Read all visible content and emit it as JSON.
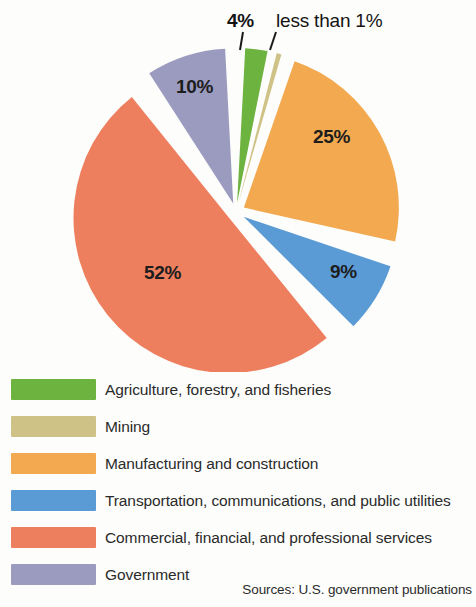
{
  "chart_data": {
    "type": "pie",
    "title": "",
    "subtitle": "",
    "xlabel": "",
    "ylabel": "",
    "grid": false,
    "legend_position": "bottom-left",
    "total": 100,
    "start_angle_deg": 0,
    "direction": "clockwise",
    "exploded": true,
    "categories": [
      "Agriculture, forestry, and fisheries",
      "Mining",
      "Manufacturing and construction",
      "Transportation, communications, and public utilities",
      "Commercial, financial, and professional services",
      "Government"
    ],
    "values": [
      4,
      0.5,
      25,
      9,
      52,
      10
    ],
    "value_labels": [
      "4%",
      "less than 1%",
      "25%",
      "9%",
      "52%",
      "10%"
    ],
    "colors": [
      "#6DB33F",
      "#CFC286",
      "#F2A950",
      "#5B9BD5",
      "#EE7F5E",
      "#9B9BC0"
    ],
    "slices": [
      {
        "label": "Agriculture, forestry, and fisheries",
        "value": 4,
        "value_label": "4%",
        "color": "#6DB33F",
        "label_placement": "callout-outside-top"
      },
      {
        "label": "Mining",
        "value": 0.5,
        "value_label": "less than 1%",
        "color": "#CFC286",
        "label_placement": "callout-outside-top"
      },
      {
        "label": "Manufacturing and construction",
        "value": 25,
        "value_label": "25%",
        "color": "#F2A950",
        "label_placement": "inside"
      },
      {
        "label": "Transportation, communications, and public utilities",
        "value": 9,
        "value_label": "9%",
        "color": "#5B9BD5",
        "label_placement": "inside"
      },
      {
        "label": "Commercial, financial, and professional services",
        "value": 52,
        "value_label": "52%",
        "color": "#EE7F5E",
        "label_placement": "inside"
      },
      {
        "label": "Government",
        "value": 10,
        "value_label": "10%",
        "color": "#9B9BC0",
        "label_placement": "inside"
      }
    ]
  },
  "callouts": {
    "agriculture": "4%",
    "mining": "less than 1%"
  },
  "slice_values": {
    "manufacturing": "25%",
    "transportation": "9%",
    "commercial": "52%",
    "government": "10%"
  },
  "legend": {
    "items": [
      {
        "label": "Agriculture, forestry, and fisheries",
        "color": "#6DB33F"
      },
      {
        "label": "Mining",
        "color": "#CFC286"
      },
      {
        "label": "Manufacturing and construction",
        "color": "#F2A950"
      },
      {
        "label": "Transportation, communications, and public utilities",
        "color": "#5B9BD5"
      },
      {
        "label": "Commercial, financial, and professional services",
        "color": "#EE7F5E"
      },
      {
        "label": "Government",
        "color": "#9B9BC0"
      }
    ]
  },
  "footer": {
    "source": "Sources: U.S. government publications"
  }
}
